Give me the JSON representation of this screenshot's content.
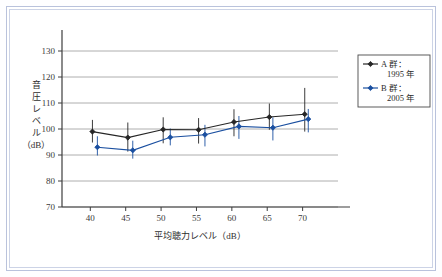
{
  "chart_data": {
    "type": "scatter",
    "title": "",
    "xlabel": "平均聴力レベル（dB）",
    "ylabel": "音圧レベル（dB）",
    "ylabel_chars": [
      "音",
      "圧",
      "レ",
      "ベ",
      "ル"
    ],
    "ylabel_unit": "（dB）",
    "xlim": [
      36,
      75
    ],
    "ylim": [
      70,
      135
    ],
    "xticks": [
      40,
      45,
      50,
      55,
      60,
      65,
      70
    ],
    "yticks": [
      70,
      80,
      90,
      100,
      110,
      120,
      130
    ],
    "grid": "horizontal",
    "legend_position": "right-outside",
    "series": [
      {
        "name": "A 群：1995 年",
        "name_line1": "A 群：",
        "name_line2": "1995 年",
        "color": "#262626",
        "marker": "diamond",
        "x": [
          40.3,
          45.3,
          50.3,
          55.3,
          60.3,
          65.3,
          70.3
        ],
        "values": [
          99.0,
          96.7,
          99.8,
          99.7,
          102.7,
          104.6,
          105.7
        ],
        "err_low": [
          94.8,
          91.3,
          94.5,
          94.4,
          97.2,
          99.7,
          99.0
        ],
        "err_high": [
          103.5,
          102.5,
          104.5,
          104.2,
          107.6,
          109.8,
          115.8
        ]
      },
      {
        "name": "B 群：2005 年",
        "name_line1": "B 群：",
        "name_line2": "2005 年",
        "color": "#1a4fa0",
        "marker": "diamond",
        "x": [
          41.0,
          46.0,
          51.3,
          56.2,
          61.0,
          65.8,
          70.8
        ],
        "values": [
          93.0,
          91.8,
          96.8,
          97.8,
          101.0,
          100.5,
          103.8
        ],
        "err_low": [
          89.8,
          88.6,
          93.7,
          93.3,
          96.2,
          95.6,
          98.7
        ],
        "err_high": [
          97.2,
          95.5,
          100.2,
          101.6,
          105.0,
          104.5,
          107.7
        ]
      }
    ]
  },
  "axes": {
    "x_tick_labels": [
      "40",
      "45",
      "50",
      "55",
      "60",
      "65",
      "70"
    ],
    "y_tick_labels": [
      "70",
      "80",
      "90",
      "100",
      "110",
      "120",
      "130"
    ]
  },
  "legend": {
    "items": [
      {
        "line1": "A 群：",
        "line2": "1995 年",
        "color": "#262626"
      },
      {
        "line1": "B 群：",
        "line2": "2005 年",
        "color": "#1a4fa0"
      }
    ]
  },
  "colors": {
    "series_a": "#262626",
    "series_b": "#1a4fa0",
    "grid": "#9a9a9a",
    "axis": "#3d3d3d",
    "frame": "#b9c2dc"
  }
}
